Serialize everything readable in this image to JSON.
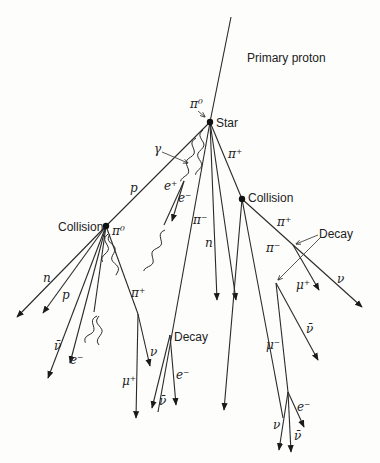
{
  "figure": {
    "nodes": [
      {
        "id": "star",
        "label": "Star",
        "x": 210,
        "y": 122,
        "lx": 216,
        "ly": 127
      },
      {
        "id": "collision-left",
        "label": "Collision",
        "x": 106,
        "y": 226,
        "lx": 58,
        "ly": 230
      },
      {
        "id": "collision-right",
        "label": "Collision",
        "x": 242,
        "y": 199,
        "lx": 248,
        "ly": 201
      }
    ],
    "labels": {
      "primary_proton": "Primary proton",
      "star": "Star",
      "collision_left": "Collision",
      "collision_right": "Collision",
      "decay_right": "Decay",
      "decay_middle": "Decay"
    },
    "particle_labels": [
      {
        "text": "π⁰",
        "x": 190,
        "y": 108
      },
      {
        "text": "γ",
        "x": 154,
        "y": 153
      },
      {
        "text": "π⁺",
        "x": 228,
        "y": 158
      },
      {
        "text": "e⁺",
        "x": 164,
        "y": 190
      },
      {
        "text": "e⁻",
        "x": 178,
        "y": 202
      },
      {
        "text": "p",
        "x": 130,
        "y": 192
      },
      {
        "text": "π⁰",
        "x": 112,
        "y": 235
      },
      {
        "text": "π⁻",
        "x": 193,
        "y": 224
      },
      {
        "text": "n",
        "x": 205,
        "y": 247
      },
      {
        "text": "π⁺",
        "x": 277,
        "y": 226
      },
      {
        "text": "π⁻",
        "x": 266,
        "y": 252
      },
      {
        "text": "n",
        "x": 43,
        "y": 282
      },
      {
        "text": "p",
        "x": 62,
        "y": 299
      },
      {
        "text": "π⁺",
        "x": 131,
        "y": 297
      },
      {
        "text": "μ⁺",
        "x": 296,
        "y": 289
      },
      {
        "text": "ν",
        "x": 337,
        "y": 283
      },
      {
        "text": "ν̄",
        "x": 306,
        "y": 333
      },
      {
        "text": "μ⁻",
        "x": 266,
        "y": 349
      },
      {
        "text": "ν̄",
        "x": 54,
        "y": 350
      },
      {
        "text": "e⁻",
        "x": 70,
        "y": 364
      },
      {
        "text": "ν",
        "x": 150,
        "y": 356
      },
      {
        "text": "μ⁺",
        "x": 122,
        "y": 385
      },
      {
        "text": "e⁻",
        "x": 176,
        "y": 379
      },
      {
        "text": "ν̄",
        "x": 159,
        "y": 405
      },
      {
        "text": "e⁻",
        "x": 297,
        "y": 411
      },
      {
        "text": "ν",
        "x": 273,
        "y": 429
      },
      {
        "text": "ν̄",
        "x": 294,
        "y": 440
      }
    ],
    "tracks": [
      {
        "name": "primary-proton",
        "d": "M231,17 L210,122",
        "arrow": false
      },
      {
        "name": "p-to-left-collision",
        "d": "M210,122 L106,226",
        "arrow": false
      },
      {
        "name": "pi-plus-to-right-collision",
        "d": "M210,122 L242,199",
        "arrow": false
      },
      {
        "name": "pi-minus-long",
        "d": "M210,122 L158,412",
        "arrow": false
      },
      {
        "name": "n-star",
        "d": "M210,122 L217,300",
        "arrow": true
      },
      {
        "name": "star-long-right",
        "d": "M210,122 L236,300",
        "arrow": true
      },
      {
        "name": "e-minus-star",
        "d": "M184,181 L172,221",
        "arrow": true
      },
      {
        "name": "e-plus-star",
        "d": "M184,181 L164,225",
        "arrow": false
      },
      {
        "name": "n-left",
        "d": "M106,226 L17,317",
        "arrow": true
      },
      {
        "name": "p-left",
        "d": "M106,226 L43,313",
        "arrow": true
      },
      {
        "name": "pi-left-1",
        "d": "M106,226 L48,378",
        "arrow": true
      },
      {
        "name": "pi-left-2",
        "d": "M106,226 L70,363",
        "arrow": true
      },
      {
        "name": "pi-left-3",
        "d": "M106,226 L94,312",
        "arrow": false
      },
      {
        "name": "pi-plus-left",
        "d": "M106,226 L138,314",
        "arrow": false
      },
      {
        "name": "pi-plus-decay-nu",
        "d": "M138,314 L150,366",
        "arrow": true
      },
      {
        "name": "pi-plus-decay-mu",
        "d": "M138,314 L136,418",
        "arrow": true
      },
      {
        "name": "decay-mid-e",
        "d": "M170,335 L176,405",
        "arrow": true
      },
      {
        "name": "decay-mid-nubar",
        "d": "M170,335 L152,408",
        "arrow": true
      },
      {
        "name": "right-coll-down-1",
        "d": "M242,199 L224,410",
        "arrow": true
      },
      {
        "name": "pi-minus-right",
        "d": "M242,199 L283,418",
        "arrow": false
      },
      {
        "name": "pi-plus-right",
        "d": "M242,199 L362,307",
        "arrow": true
      },
      {
        "name": "pi-plus-right-mu",
        "d": "M293,245 L319,290",
        "arrow": true
      },
      {
        "name": "right-coll-nubar",
        "d": "M276,283 L318,360",
        "arrow": true
      },
      {
        "name": "mu-minus-to-decay",
        "d": "M276,283 L288,392",
        "arrow": false
      },
      {
        "name": "final-e",
        "d": "M288,392 L304,427",
        "arrow": true
      },
      {
        "name": "final-nu",
        "d": "M288,392 L279,450",
        "arrow": true
      },
      {
        "name": "final-nubar",
        "d": "M288,392 L291,452",
        "arrow": true
      }
    ],
    "wavy_tracks": [
      {
        "name": "gamma-1",
        "x1": 203,
        "y1": 130,
        "x2": 198,
        "y2": 175
      },
      {
        "name": "gamma-2",
        "x1": 196,
        "y1": 138,
        "x2": 183,
        "y2": 182
      },
      {
        "name": "gamma-3",
        "x1": 165,
        "y1": 230,
        "x2": 146,
        "y2": 272
      },
      {
        "name": "gamma-left-1",
        "x1": 110,
        "y1": 234,
        "x2": 117,
        "y2": 275
      },
      {
        "name": "gamma-left-2",
        "x1": 108,
        "y1": 234,
        "x2": 104,
        "y2": 262
      },
      {
        "name": "gamma-left-3",
        "x1": 97,
        "y1": 316,
        "x2": 86,
        "y2": 343
      },
      {
        "name": "gamma-left-4",
        "x1": 99,
        "y1": 316,
        "x2": 100,
        "y2": 345
      }
    ],
    "pointers": [
      {
        "name": "gamma-pointer",
        "d": "M162,152 L188,163"
      },
      {
        "name": "pi0-pointer",
        "d": "M198,111 L205,117"
      },
      {
        "name": "decay-pointer-1",
        "d": "M318,235 L296,244"
      },
      {
        "name": "decay-pointer-2",
        "d": "M320,238 L278,280"
      }
    ]
  }
}
